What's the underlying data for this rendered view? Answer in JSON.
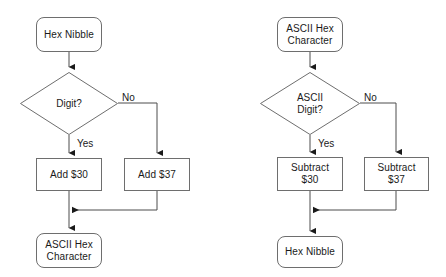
{
  "canvas": {
    "width": 446,
    "height": 277,
    "background": "#ffffff",
    "stroke_color": "#6e6e6e",
    "line_color": "#4d4d4d",
    "text_color": "#1a1a1a"
  },
  "charts": {
    "left": {
      "title": "Hex Nibble to ASCII Hex Character",
      "nodes": {
        "start": "Hex Nibble",
        "decision": "Digit?",
        "yes_action": "Add $30",
        "no_action": "Add $37",
        "end": "ASCII Hex\nCharacter"
      },
      "edges": {
        "yes_label": "Yes",
        "no_label": "No"
      }
    },
    "right": {
      "title": "ASCII Hex Character to Hex Nibble",
      "nodes": {
        "start": "ASCII Hex\nCharacter",
        "decision": "ASCII\nDigit?",
        "yes_action": "Subtract\n$30",
        "no_action": "Subtract\n$37",
        "end": "Hex Nibble"
      },
      "edges": {
        "yes_label": "Yes",
        "no_label": "No"
      }
    }
  }
}
